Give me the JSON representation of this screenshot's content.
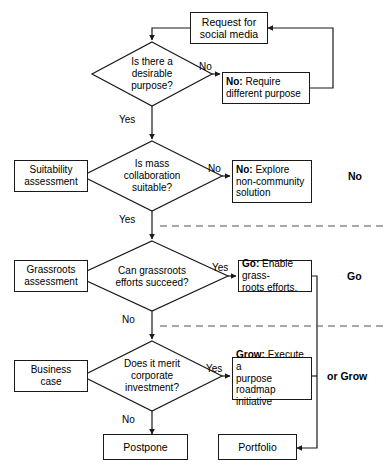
{
  "diagram": {
    "type": "flowchart",
    "colors": {
      "stroke": "#1a1a1a",
      "fill": "#ffffff",
      "text": "#000000",
      "dashed_separator": "#555555"
    },
    "nodes": [
      {
        "id": "request",
        "kind": "process",
        "label": "Request for\nsocial media",
        "bold_lead": ""
      },
      {
        "id": "q-purpose",
        "kind": "decision",
        "label": "Is there a\ndesirable\npurpose?"
      },
      {
        "id": "no-purpose",
        "kind": "process",
        "bold_lead": "No:",
        "label": " Require\ndifferent purpose"
      },
      {
        "id": "suitability",
        "kind": "process",
        "label": "Suitability\nassessment"
      },
      {
        "id": "q-mass",
        "kind": "decision",
        "label": "Is mass\ncollaboration\nsuitable?"
      },
      {
        "id": "no-explore",
        "kind": "process",
        "bold_lead": "No:",
        "label": " Explore\nnon-community\nsolution"
      },
      {
        "id": "grassroots",
        "kind": "process",
        "label": "Grassroots\nassessment"
      },
      {
        "id": "q-grassroots",
        "kind": "decision",
        "label": "Can grassroots\nefforts succeed?"
      },
      {
        "id": "go-grassroots",
        "kind": "process",
        "bold_lead": "Go:",
        "label": " Enable grass-\nroots efforts."
      },
      {
        "id": "business",
        "kind": "process",
        "label": "Business\ncase"
      },
      {
        "id": "q-invest",
        "kind": "decision",
        "label": "Does it merit\ncorporate\ninvestment?"
      },
      {
        "id": "grow-roadmap",
        "kind": "process",
        "bold_lead": "Grow:",
        "label": " Execute a\npurpose roadmap\ninitiative"
      },
      {
        "id": "postpone",
        "kind": "terminator",
        "label": "Postpone"
      },
      {
        "id": "portfolio",
        "kind": "terminator",
        "label": "Portfolio"
      }
    ],
    "edge_labels": [
      {
        "id": "no-1",
        "text": "No"
      },
      {
        "id": "yes-1",
        "text": "Yes"
      },
      {
        "id": "no-2",
        "text": "No"
      },
      {
        "id": "yes-2",
        "text": "Yes"
      },
      {
        "id": "yes-3",
        "text": "Yes"
      },
      {
        "id": "no-3",
        "text": "No"
      },
      {
        "id": "yes-4",
        "text": "Yes"
      },
      {
        "id": "no-4",
        "text": "No"
      }
    ],
    "outcome_labels": [
      {
        "id": "outcome-no",
        "text": "No"
      },
      {
        "id": "outcome-go",
        "text": "Go"
      },
      {
        "id": "outcome-grow",
        "text": "or Grow"
      }
    ]
  }
}
